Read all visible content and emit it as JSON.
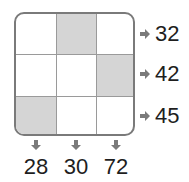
{
  "puzzle": {
    "grid": [
      [
        {
          "shaded": false
        },
        {
          "shaded": true
        },
        {
          "shaded": false
        }
      ],
      [
        {
          "shaded": false
        },
        {
          "shaded": false
        },
        {
          "shaded": true
        }
      ],
      [
        {
          "shaded": true
        },
        {
          "shaded": false
        },
        {
          "shaded": false
        }
      ]
    ],
    "row_clues": [
      "32",
      "42",
      "45"
    ],
    "column_clues": [
      "28",
      "30",
      "72"
    ],
    "icons": {
      "row_arrow": "arrow-right-icon",
      "column_arrow": "arrow-down-icon"
    },
    "colors": {
      "shaded": "#d5d5d5",
      "border": "#7a7a7a",
      "arrow": "#7a7a7a",
      "text": "#1e1e1e"
    }
  }
}
